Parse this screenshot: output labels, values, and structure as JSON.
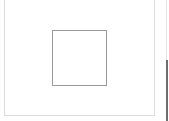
{
  "canvas": {
    "background": "#ffffff",
    "outer_frame": {
      "shape": "rectangle",
      "border_color": "#dcdcdc"
    },
    "inner_shape": {
      "shape": "square",
      "border_color": "#9a9a9a",
      "fill": "#ffffff"
    },
    "right_edge": {
      "top_color": "#e6e6e6",
      "bottom_color": "#6e6e6e"
    }
  }
}
